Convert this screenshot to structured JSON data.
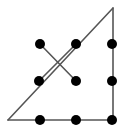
{
  "figure": {
    "type": "geometric-diagram",
    "canvas": {
      "width": 131,
      "height": 130
    },
    "background_color": "#ffffff",
    "line_color": "#555555",
    "dot_color": "#000000",
    "line_width": 1.6,
    "dot_radius": 5.0,
    "triangle": {
      "name": "right-triangle",
      "vertices": [
        {
          "name": "left-corner",
          "x": 8,
          "y": 120
        },
        {
          "name": "apex-top-right",
          "x": 113,
          "y": 8
        },
        {
          "name": "bottom-right-corner",
          "x": 113,
          "y": 120
        }
      ],
      "edges": [
        {
          "name": "bottom-edge",
          "from": "left-corner",
          "to": "bottom-right-corner",
          "x1": 8,
          "y1": 120,
          "x2": 113,
          "y2": 120
        },
        {
          "name": "right-edge",
          "from": "bottom-right-corner",
          "to": "apex-top-right",
          "x1": 113,
          "y1": 120,
          "x2": 113,
          "y2": 8
        },
        {
          "name": "hypotenuse-edge",
          "from": "apex-top-right",
          "to": "left-corner",
          "x1": 113,
          "y1": 8,
          "x2": 8,
          "y2": 120
        }
      ]
    },
    "cross_segments": [
      {
        "name": "cross-segment-down-right",
        "from": "dot-top-left",
        "to": "dot-middle-center",
        "x1": 40,
        "y1": 44,
        "x2": 76,
        "y2": 81
      },
      {
        "name": "cross-segment-up-right",
        "from": "dot-middle-left",
        "to": "dot-top-middle",
        "x1": 39,
        "y1": 81,
        "x2": 76,
        "y2": 44
      }
    ],
    "dots": [
      {
        "name": "dot-top-left",
        "row": 0,
        "col": 0,
        "x": 40,
        "y": 44
      },
      {
        "name": "dot-top-middle",
        "row": 0,
        "col": 1,
        "x": 76,
        "y": 44
      },
      {
        "name": "dot-top-right",
        "row": 0,
        "col": 2,
        "x": 112,
        "y": 44
      },
      {
        "name": "dot-middle-left",
        "row": 1,
        "col": 0,
        "x": 39,
        "y": 81
      },
      {
        "name": "dot-middle-center",
        "row": 1,
        "col": 1,
        "x": 76,
        "y": 81
      },
      {
        "name": "dot-middle-right",
        "row": 1,
        "col": 2,
        "x": 112,
        "y": 81
      },
      {
        "name": "dot-bottom-left",
        "row": 2,
        "col": 0,
        "x": 40,
        "y": 120
      },
      {
        "name": "dot-bottom-middle",
        "row": 2,
        "col": 1,
        "x": 76,
        "y": 120
      },
      {
        "name": "dot-bottom-right",
        "row": 2,
        "col": 2,
        "x": 112,
        "y": 120
      }
    ]
  }
}
